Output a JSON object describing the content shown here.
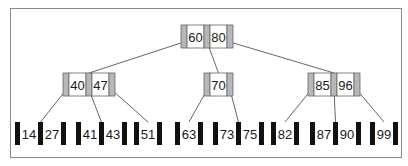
{
  "diagram": {
    "type": "b-tree",
    "colors": {
      "internal_pointer": "#b8b8b8",
      "leaf_pointer": "#111111",
      "cell_bg": "#ffffff",
      "edge": "#555555",
      "border": "#666666"
    },
    "root": {
      "id": "root",
      "keys": [
        "60",
        "80"
      ],
      "x": 181,
      "y": 25
    },
    "internal": [
      {
        "id": "n1",
        "keys": [
          "40",
          "47"
        ],
        "x": 63,
        "y": 73
      },
      {
        "id": "n2",
        "keys": [
          "70"
        ],
        "x": 204,
        "y": 73
      },
      {
        "id": "n3",
        "keys": [
          "85",
          "96"
        ],
        "x": 308,
        "y": 73
      }
    ],
    "leaves": [
      {
        "id": "l1",
        "keys": [
          "14",
          "27"
        ],
        "x": 15,
        "y": 122
      },
      {
        "id": "l2",
        "keys": [
          "41",
          "43"
        ],
        "x": 76,
        "y": 122
      },
      {
        "id": "l3",
        "keys": [
          "51"
        ],
        "x": 134,
        "y": 122
      },
      {
        "id": "l4",
        "keys": [
          "63"
        ],
        "x": 175,
        "y": 122
      },
      {
        "id": "l5",
        "keys": [
          "73",
          "75"
        ],
        "x": 213,
        "y": 122
      },
      {
        "id": "l6",
        "keys": [
          "82"
        ],
        "x": 271,
        "y": 122
      },
      {
        "id": "l7",
        "keys": [
          "87",
          "90"
        ],
        "x": 310,
        "y": 122
      },
      {
        "id": "l8",
        "keys": [
          "99"
        ],
        "x": 370,
        "y": 122
      }
    ],
    "edges": [
      {
        "from": "root",
        "ptr": 0,
        "to": "n1"
      },
      {
        "from": "root",
        "ptr": 1,
        "to": "n2"
      },
      {
        "from": "root",
        "ptr": 2,
        "to": "n3"
      },
      {
        "from": "n1",
        "ptr": 0,
        "to": "l1"
      },
      {
        "from": "n1",
        "ptr": 1,
        "to": "l2"
      },
      {
        "from": "n1",
        "ptr": 2,
        "to": "l3"
      },
      {
        "from": "n2",
        "ptr": 0,
        "to": "l4"
      },
      {
        "from": "n2",
        "ptr": 1,
        "to": "l5"
      },
      {
        "from": "n3",
        "ptr": 0,
        "to": "l6"
      },
      {
        "from": "n3",
        "ptr": 1,
        "to": "l7"
      },
      {
        "from": "n3",
        "ptr": 2,
        "to": "l8"
      }
    ]
  }
}
